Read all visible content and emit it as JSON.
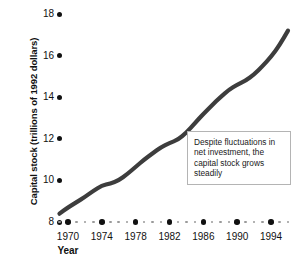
{
  "chart_data": {
    "type": "line",
    "title": "",
    "xlabel": "Year",
    "ylabel": "Capital stock (trillions of 1992 dollars)",
    "xlim": [
      1969,
      1996
    ],
    "ylim": [
      8,
      18
    ],
    "yticks": [
      8,
      10,
      12,
      14,
      16,
      18
    ],
    "xticks": [
      1970,
      1974,
      1978,
      1982,
      1986,
      1990,
      1994
    ],
    "grid": false,
    "legend": null,
    "series": [
      {
        "name": "Capital stock",
        "color": "#3d3d3d",
        "x": [
          1969,
          1970,
          1971,
          1972,
          1973,
          1974,
          1975,
          1976,
          1977,
          1978,
          1979,
          1980,
          1981,
          1982,
          1983,
          1984,
          1985,
          1986,
          1987,
          1988,
          1989,
          1990,
          1991,
          1992,
          1993,
          1994,
          1995,
          1996
        ],
        "values": [
          8.4,
          8.7,
          8.95,
          9.2,
          9.5,
          9.75,
          9.85,
          10.0,
          10.3,
          10.65,
          11.0,
          11.3,
          11.6,
          11.8,
          11.95,
          12.3,
          12.75,
          13.2,
          13.6,
          14.0,
          14.35,
          14.6,
          14.8,
          15.1,
          15.5,
          15.95,
          16.5,
          17.2
        ]
      }
    ],
    "annotations": [
      {
        "name": "capital-stock-note",
        "text": "Despite fluctuations in net investment, the capital stock grows steadily"
      }
    ]
  },
  "axes": {
    "y": {
      "title": "Capital stock (trillions of 1992 dollars)",
      "ticks": [
        {
          "label": "18",
          "value": 18
        },
        {
          "label": "16",
          "value": 16
        },
        {
          "label": "14",
          "value": 14
        },
        {
          "label": "12",
          "value": 12
        },
        {
          "label": "10",
          "value": 10
        },
        {
          "label": "8",
          "value": 8
        }
      ]
    },
    "x": {
      "title": "Year",
      "ticks": [
        {
          "label": "1970",
          "value": 1970
        },
        {
          "label": "1974",
          "value": 1974
        },
        {
          "label": "1978",
          "value": 1978
        },
        {
          "label": "1982",
          "value": 1982
        },
        {
          "label": "1986",
          "value": 1986
        },
        {
          "label": "1990",
          "value": 1990
        },
        {
          "label": "1994",
          "value": 1994
        }
      ]
    }
  },
  "annotation": {
    "text": "Despite fluctuations in net investment, the capital stock grows steadily"
  },
  "colors": {
    "line": "#3d3d3d",
    "tick_major": "#111111",
    "tick_minor": "#9a9a9a",
    "annotation_border": "#b4b4b4",
    "background": "#ffffff"
  },
  "caption_sliver": ""
}
